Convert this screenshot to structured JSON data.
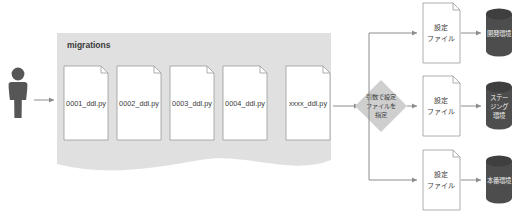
{
  "diagram": {
    "title_text": "migrations",
    "actor": {
      "icon": "person-icon"
    },
    "migrations_group": {
      "label": "migrations",
      "files": [
        {
          "icon": "document-icon",
          "name": "0001_ddl.py"
        },
        {
          "icon": "document-icon",
          "name": "0002_ddl.py"
        },
        {
          "icon": "document-icon",
          "name": "0003_ddl.py"
        },
        {
          "icon": "document-icon",
          "name": "0004_ddl.py"
        },
        {
          "icon": "document-icon",
          "name": "xxxx_ddl.py"
        }
      ]
    },
    "decision": {
      "icon": "diamond-decision-icon",
      "lines": [
        "引数で設定",
        "ファイルを",
        "指定"
      ]
    },
    "branches": [
      {
        "config_file": {
          "icon": "document-icon",
          "lines": [
            "設定",
            "ファイル"
          ]
        },
        "environment": {
          "icon": "database-cylinder-icon",
          "lines": [
            "開発環境"
          ]
        }
      },
      {
        "config_file": {
          "icon": "document-icon",
          "lines": [
            "設定",
            "ファイル"
          ]
        },
        "environment": {
          "icon": "database-cylinder-icon",
          "lines": [
            "ステー",
            "ジング",
            "環境"
          ]
        }
      },
      {
        "config_file": {
          "icon": "document-icon",
          "lines": [
            "設定",
            "ファイル"
          ]
        },
        "environment": {
          "icon": "database-cylinder-icon",
          "lines": [
            "本番環境"
          ]
        }
      }
    ],
    "colors": {
      "group_fill": "#e0e0e0",
      "doc_fill": "#ffffff",
      "doc_stroke": "#9a9a9a",
      "decision_fill": "#cfcfcf",
      "cylinder_fill": "#4d4d4d",
      "cylinder_top": "#3f3f3f",
      "actor_fill": "#565656",
      "line_stroke": "#8c8c8c",
      "text_dark": "#3a3a3a",
      "text_light": "#f2f2f2"
    }
  }
}
